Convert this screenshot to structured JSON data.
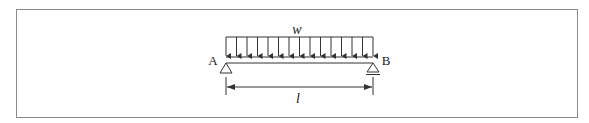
{
  "diagram": {
    "type": "simply-supported-beam-uniform-load",
    "load_label": "w",
    "support_left_label": "A",
    "support_right_label": "B",
    "span_label": "l",
    "left_support_type": "pin",
    "right_support_type": "roller",
    "arrow_count": 15,
    "line_color": "#333333",
    "frame_color": "#8a8a8a"
  }
}
